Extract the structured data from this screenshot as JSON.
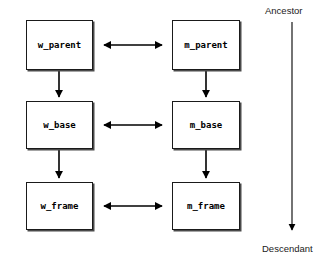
{
  "diagram": {
    "type": "block-diagram",
    "title": "",
    "background_color": "#ffffff",
    "stroke_color": "#000000",
    "nodes": [
      {
        "id": "w_parent",
        "label": "w_parent",
        "column": "left",
        "row": 1,
        "x": 26,
        "y": 20,
        "width": 67,
        "height": 50
      },
      {
        "id": "m_parent",
        "label": "m_parent",
        "column": "right",
        "row": 1,
        "x": 172,
        "y": 20,
        "width": 68,
        "height": 50
      },
      {
        "id": "w_base",
        "label": "w_base",
        "column": "left",
        "row": 2,
        "x": 26,
        "y": 101,
        "width": 67,
        "height": 48
      },
      {
        "id": "m_base",
        "label": "m_base",
        "column": "right",
        "row": 2,
        "x": 172,
        "y": 101,
        "width": 68,
        "height": 48
      },
      {
        "id": "w_frame",
        "label": "w_frame",
        "column": "left",
        "row": 3,
        "x": 26,
        "y": 182,
        "width": 67,
        "height": 48
      },
      {
        "id": "m_frame",
        "label": "m_frame",
        "column": "right",
        "row": 3,
        "x": 172,
        "y": 182,
        "width": 68,
        "height": 48
      }
    ],
    "edges": [
      {
        "id": "w_parent-m_parent",
        "from": "w_parent",
        "to": "m_parent",
        "orientation": "horizontal",
        "arrowheads": "both",
        "x1": 103,
        "y1": 45,
        "x2": 163,
        "y2": 45
      },
      {
        "id": "w_base-m_base",
        "from": "w_base",
        "to": "m_base",
        "orientation": "horizontal",
        "arrowheads": "both",
        "x1": 103,
        "y1": 125,
        "x2": 163,
        "y2": 125
      },
      {
        "id": "w_frame-m_frame",
        "from": "w_frame",
        "to": "m_frame",
        "orientation": "horizontal",
        "arrowheads": "both",
        "x1": 103,
        "y1": 206,
        "x2": 163,
        "y2": 206
      },
      {
        "id": "w_parent-w_base",
        "from": "w_parent",
        "to": "w_base",
        "orientation": "vertical",
        "arrowheads": "end",
        "x1": 59,
        "y1": 71,
        "x2": 59,
        "y2": 99
      },
      {
        "id": "w_base-w_frame",
        "from": "w_base",
        "to": "w_frame",
        "orientation": "vertical",
        "arrowheads": "end",
        "x1": 59,
        "y1": 150,
        "x2": 59,
        "y2": 180
      },
      {
        "id": "m_parent-m_base",
        "from": "m_parent",
        "to": "m_base",
        "orientation": "vertical",
        "arrowheads": "end",
        "x1": 206,
        "y1": 71,
        "x2": 206,
        "y2": 99
      },
      {
        "id": "m_base-m_frame",
        "from": "m_base",
        "to": "m_frame",
        "orientation": "vertical",
        "arrowheads": "end",
        "x1": 206,
        "y1": 150,
        "x2": 206,
        "y2": 180
      }
    ],
    "axis": {
      "id": "ancestry-axis",
      "top_label": "Ancestor",
      "bottom_label": "Descendant",
      "orientation": "vertical",
      "arrowheads": "end",
      "x": 292,
      "y1": 22,
      "y2": 234,
      "top_label_x": 265,
      "top_label_y": 6,
      "bottom_label_x": 263,
      "bottom_label_y": 244
    }
  }
}
